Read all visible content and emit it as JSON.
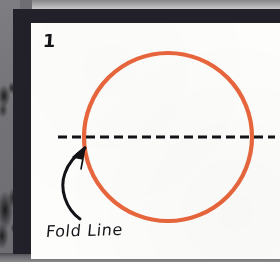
{
  "illustration": {
    "step_number": "1",
    "fold_label": "Fold Line",
    "circle": {
      "name": "orange-circle",
      "color": "#e8663c",
      "stroke_width": 4,
      "center_x": 137,
      "center_y": 114,
      "radius": 84
    },
    "fold_line": {
      "name": "fold-dashed-line",
      "color": "#131217",
      "stroke_width": 3,
      "y": 114,
      "x_start": 27,
      "x_end": 244,
      "dash": "9 5"
    },
    "arrow": {
      "name": "curved-fold-arrow",
      "color": "#131217",
      "points_to": "fold-dashed-line"
    }
  },
  "page": {
    "background_color": "#77777b",
    "frame_color": "#22212a",
    "paper_color": "#fdfdfc"
  }
}
